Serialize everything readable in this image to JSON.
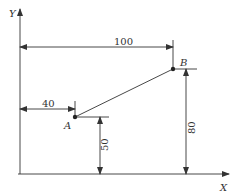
{
  "diagram": {
    "type": "coordinate-dimension-drawing",
    "axes": {
      "x_label": "X",
      "y_label": "Y"
    },
    "points": [
      {
        "name": "A",
        "x": 40,
        "y": 50
      },
      {
        "name": "B",
        "x": 100,
        "y": 80
      }
    ],
    "dimensions": {
      "b_x": "100",
      "a_x": "40",
      "a_y": "50",
      "b_y": "80"
    },
    "colors": {
      "line": "#333333",
      "background": "#ffffff"
    }
  }
}
